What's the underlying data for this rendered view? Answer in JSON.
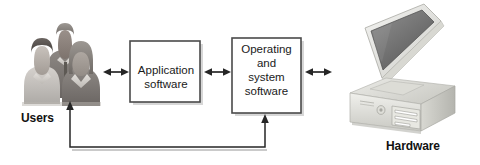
{
  "figure": {
    "type": "block-diagram",
    "background_color": "#ffffff",
    "line_color": "#333333",
    "box_fill": "#ffffff",
    "box_border_color": "#4a4a4a",
    "text_color": "#1a1a1a"
  },
  "nodes": {
    "users": {
      "label": "Users",
      "icon": "three-people-illustration",
      "kind": "actor"
    },
    "application_software": {
      "label": "Application\nsoftware",
      "line1": "Application",
      "line2": "software",
      "kind": "process-box"
    },
    "operating_and_system_software": {
      "label": "Operating\nand\nsystem\nsoftware",
      "line1": "Operating",
      "line2": "and",
      "line3": "system",
      "line4": "software",
      "kind": "process-box"
    },
    "hardware": {
      "label": "Hardware",
      "icon": "desktop-computer-illustration",
      "kind": "actor"
    }
  },
  "connectors": [
    {
      "id": "users-to-application",
      "from": "users",
      "to": "application_software",
      "style": "double-arrow"
    },
    {
      "id": "application-to-operating",
      "from": "application_software",
      "to": "operating_and_system_software",
      "style": "double-arrow"
    },
    {
      "id": "operating-to-hardware",
      "from": "operating_and_system_software",
      "to": "hardware",
      "style": "double-arrow"
    },
    {
      "id": "feedback-loop",
      "from": "operating_and_system_software",
      "to": "users",
      "style": "single-arrow-both-ends-up",
      "routing": "bottom-bus"
    }
  ]
}
